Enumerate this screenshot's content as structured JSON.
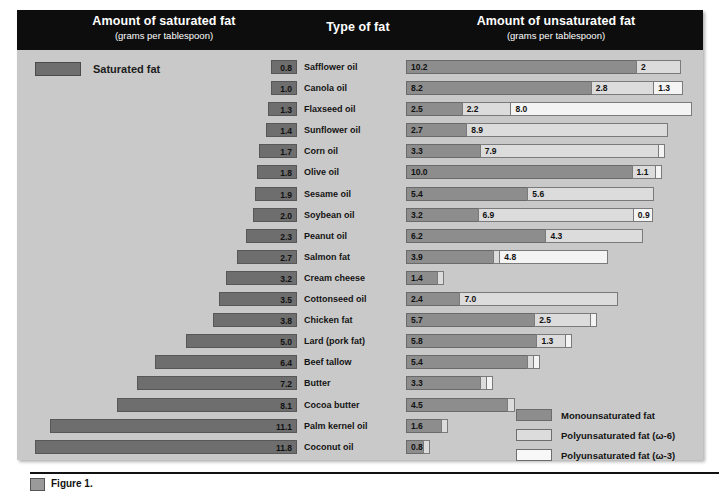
{
  "header": {
    "left_title": "Amount of saturated fat",
    "left_subtitle": "(grams per tablespoon)",
    "center_title": "Type of fat",
    "right_title": "Amount of unsaturated fat",
    "right_subtitle": "(grams per tablespoon)"
  },
  "saturated_legend": {
    "label": "Saturated fat"
  },
  "legend": {
    "items": [
      {
        "key": "mono",
        "label": "Monounsaturated fat"
      },
      {
        "key": "o6",
        "label": "Polyunsaturated fat (ω-6)"
      },
      {
        "key": "o3",
        "label": "Polyunsaturated fat (ω-3)"
      }
    ]
  },
  "caption": {
    "text": "Figure 1."
  },
  "colors": {
    "panel_background": "#c9c9c9",
    "header_background": "#0d0d0d",
    "saturated_bar": "#6e6e6e",
    "monounsaturated": "#8d8d8d",
    "polyunsaturated_omega6": "#dcdcdc",
    "polyunsaturated_omega3": "#f4f4f4"
  },
  "chart_data": {
    "type": "bar",
    "subtitle": "(grams per tablespoon)",
    "xlabel": "grams per tablespoon",
    "ylabel": "Type of fat",
    "orientation": "horizontal",
    "layout": "diverging back-to-back: saturated fat extends left, unsaturated fat stacks right",
    "grid": false,
    "legend_position": "bottom-right",
    "left_series": {
      "name": "Saturated fat",
      "color": "#6e6e6e"
    },
    "right_series": [
      {
        "name": "Monounsaturated fat",
        "color": "#8d8d8d"
      },
      {
        "name": "Polyunsaturated fat (ω-6)",
        "color": "#dcdcdc"
      },
      {
        "name": "Polyunsaturated fat (ω-3)",
        "color": "#f4f4f4"
      }
    ],
    "categories": [
      "Safflower oil",
      "Canola oil",
      "Flaxseed oil",
      "Sunflower oil",
      "Corn oil",
      "Olive oil",
      "Sesame oil",
      "Soybean oil",
      "Peanut oil",
      "Salmon fat",
      "Cream cheese",
      "Cottonseed oil",
      "Chicken fat",
      "Lard (pork fat)",
      "Beef tallow",
      "Butter",
      "Cocoa butter",
      "Palm kernel oil",
      "Coconut oil"
    ],
    "rows": [
      {
        "type": "Safflower oil",
        "saturated": 0.8,
        "mono": 10.2,
        "omega6": 2.0,
        "omega3": 0.0,
        "mono_label": "10.2",
        "omega6_label": "2",
        "omega3_label": ""
      },
      {
        "type": "Canola oil",
        "saturated": 1.0,
        "mono": 8.2,
        "omega6": 2.8,
        "omega3": 1.3,
        "mono_label": "8.2",
        "omega6_label": "2.8",
        "omega3_label": "1.3"
      },
      {
        "type": "Flaxseed oil",
        "saturated": 1.3,
        "mono": 2.5,
        "omega6": 2.2,
        "omega3": 8.0,
        "mono_label": "2.5",
        "omega6_label": "2.2",
        "omega3_label": "8.0"
      },
      {
        "type": "Sunflower oil",
        "saturated": 1.4,
        "mono": 2.7,
        "omega6": 8.9,
        "omega3": 0.0,
        "mono_label": "2.7",
        "omega6_label": "8.9",
        "omega3_label": ""
      },
      {
        "type": "Corn oil",
        "saturated": 1.7,
        "mono": 3.3,
        "omega6": 7.9,
        "omega3": 0.2,
        "mono_label": "3.3",
        "omega6_label": "7.9",
        "omega3_label": ""
      },
      {
        "type": "Olive oil",
        "saturated": 1.8,
        "mono": 10.0,
        "omega6": 1.1,
        "omega3": 0.1,
        "mono_label": "10.0",
        "omega6_label": "1.1",
        "omega3_label": ""
      },
      {
        "type": "Sesame oil",
        "saturated": 1.9,
        "mono": 5.4,
        "omega6": 5.6,
        "omega3": 0.0,
        "mono_label": "5.4",
        "omega6_label": "5.6",
        "omega3_label": ""
      },
      {
        "type": "Soybean oil",
        "saturated": 2.0,
        "mono": 3.2,
        "omega6": 6.9,
        "omega3": 0.9,
        "mono_label": "3.2",
        "omega6_label": "6.9",
        "omega3_label": "0.9"
      },
      {
        "type": "Peanut oil",
        "saturated": 2.3,
        "mono": 6.2,
        "omega6": 4.3,
        "omega3": 0.0,
        "mono_label": "6.2",
        "omega6_label": "4.3",
        "omega3_label": ""
      },
      {
        "type": "Salmon fat",
        "saturated": 2.7,
        "mono": 3.9,
        "omega6": 0.2,
        "omega3": 4.8,
        "mono_label": "3.9",
        "omega6_label": "",
        "omega3_label": "4.8"
      },
      {
        "type": "Cream cheese",
        "saturated": 3.2,
        "mono": 1.4,
        "omega6": 0.15,
        "omega3": 0.0,
        "mono_label": "1.4",
        "omega6_label": "",
        "omega3_label": ""
      },
      {
        "type": "Cottonseed oil",
        "saturated": 3.5,
        "mono": 2.4,
        "omega6": 7.0,
        "omega3": 0.0,
        "mono_label": "2.4",
        "omega6_label": "7.0",
        "omega3_label": ""
      },
      {
        "type": "Chicken fat",
        "saturated": 3.8,
        "mono": 5.7,
        "omega6": 2.5,
        "omega3": 0.1,
        "mono_label": "5.7",
        "omega6_label": "2.5",
        "omega3_label": ""
      },
      {
        "type": "Lard (pork fat)",
        "saturated": 5.0,
        "mono": 5.8,
        "omega6": 1.3,
        "omega3": 0.1,
        "mono_label": "5.8",
        "omega6_label": "1.3",
        "omega3_label": ""
      },
      {
        "type": "Beef tallow",
        "saturated": 6.4,
        "mono": 5.4,
        "omega6": 0.2,
        "omega3": 0.1,
        "mono_label": "5.4",
        "omega6_label": "",
        "omega3_label": ""
      },
      {
        "type": "Butter",
        "saturated": 7.2,
        "mono": 3.3,
        "omega6": 0.25,
        "omega3": 0.15,
        "mono_label": "3.3",
        "omega6_label": "",
        "omega3_label": ""
      },
      {
        "type": "Cocoa butter",
        "saturated": 8.1,
        "mono": 4.5,
        "omega6": 0.35,
        "omega3": 0.0,
        "mono_label": "4.5",
        "omega6_label": "",
        "omega3_label": ""
      },
      {
        "type": "Palm kernel oil",
        "saturated": 11.1,
        "mono": 1.6,
        "omega6": 0.2,
        "omega3": 0.0,
        "mono_label": "1.6",
        "omega6_label": "",
        "omega3_label": ""
      },
      {
        "type": "Coconut oil",
        "saturated": 11.8,
        "mono": 0.8,
        "omega6": 0.2,
        "omega3": 0.0,
        "mono_label": "0.8",
        "omega6_label": "",
        "omega3_label": ""
      }
    ],
    "saturated_axis_max": 12.6,
    "unsaturated_axis_max": 12.8
  }
}
